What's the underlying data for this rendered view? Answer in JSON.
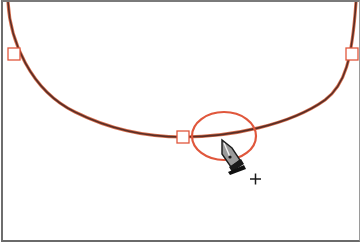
{
  "canvas": {
    "background": "#ffffff",
    "frame_color": "#6e6e6e"
  },
  "path": {
    "stroke_color": "#6b3a2e",
    "highlight_color": "#e0573c",
    "anchor_points": [
      {
        "name": "left",
        "x": 14,
        "y": 54
      },
      {
        "name": "bottom",
        "x": 183,
        "y": 137
      },
      {
        "name": "right",
        "x": 352,
        "y": 54
      }
    ]
  },
  "highlight_ellipse": {
    "cx": 224,
    "cy": 136,
    "rx": 32,
    "ry": 24,
    "color": "#e0573c"
  },
  "cursor": {
    "tool": "pen-tool-add-anchor",
    "modifier_glyph": "+",
    "x": 222,
    "y": 140
  }
}
